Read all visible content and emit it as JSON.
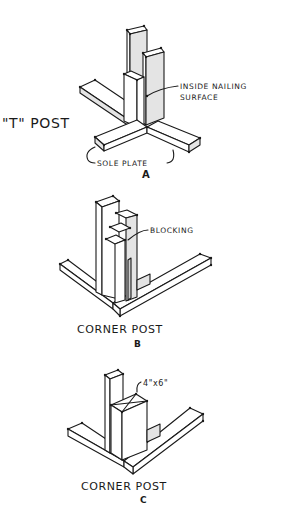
{
  "figures": [
    {
      "id": "A",
      "title": "\"T\" POST",
      "letter": "A",
      "callouts": [
        {
          "line1": "INSIDE NAILING",
          "line2": "SURFACE"
        },
        {
          "line1": "SOLE PLATE"
        }
      ]
    },
    {
      "id": "B",
      "title": "CORNER POST",
      "letter": "B",
      "callouts": [
        {
          "line1": "BLOCKING"
        }
      ]
    },
    {
      "id": "C",
      "title": "CORNER POST",
      "letter": "C",
      "callouts": [
        {
          "line1": "4\"x6\""
        }
      ]
    }
  ]
}
